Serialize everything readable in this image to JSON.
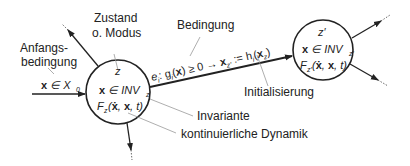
{
  "diagram": {
    "type": "hybrid-automaton",
    "labels": {
      "state_title_line1": "Zustand",
      "state_title_line2": "o. Modus",
      "initial_condition_line1": "Anfangs-",
      "initial_condition_line2": "bedingung",
      "initial_condition_expr": "x ∈ X",
      "initial_condition_sub": "0",
      "condition": "Bedingung",
      "initialization": "Initialisierung",
      "invariant": "Invariante",
      "continuous_dynamics": "kontinuierliche Dynamik"
    },
    "state_left": {
      "name": "z",
      "invariant_expr": "x ∈ INV",
      "invariant_sub": "z",
      "dynamics_expr": "F",
      "dynamics_sub": "z",
      "dynamics_args": "(ẋ, x, t)"
    },
    "state_right": {
      "name": "z′",
      "invariant_expr": "x ∈ INV",
      "invariant_sub": "z′",
      "dynamics_expr": "F",
      "dynamics_sub": "z′",
      "dynamics_args": "(ẋ, x, t)"
    },
    "transition": {
      "edge": "e",
      "edge_sub": "i",
      "guard": ": g",
      "guard_sub": "i",
      "guard_rest": "(x) ≥ 0  →  x",
      "reset_sub": "z′",
      "reset_rest": " := h",
      "reset_func_sub": "i",
      "reset_args": "(x",
      "reset_args_sub": "z",
      "reset_close": ")"
    },
    "colors": {
      "line": "#222222",
      "leader": "#999999",
      "text": "#222222"
    }
  }
}
